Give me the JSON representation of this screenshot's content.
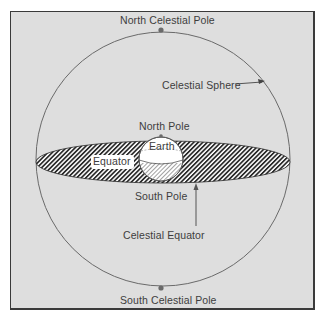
{
  "figure": {
    "labels": {
      "north_celestial_pole": "North Celestial Pole",
      "celestial_sphere": "Celestial Sphere",
      "north_pole": "North Pole",
      "earth": "Earth",
      "equator": "Equator",
      "south_pole": "South Pole",
      "celestial_equator": "Celestial Equator",
      "south_celestial_pole": "South Celestial Pole"
    },
    "colors": {
      "background": "#dedede",
      "line": "#6a6a6a",
      "hatch": "#2a2a2a",
      "earth": "#ffffff",
      "text": "#3d3d3d"
    }
  }
}
